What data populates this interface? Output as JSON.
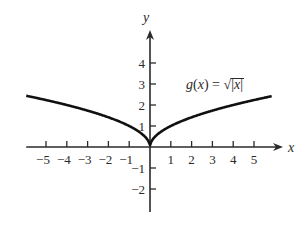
{
  "chart_data": {
    "type": "line",
    "title": "",
    "function_label": "g(x) = √|x|",
    "function_label_parts": {
      "name": "g",
      "open_paren": "(",
      "var": "x",
      "close_paren": ")",
      "equals": " = ",
      "radical": "√",
      "abs_open": "|",
      "abs_var": "x",
      "abs_close": "|"
    },
    "xlabel": "x",
    "ylabel": "y",
    "xlim": [
      -6,
      6.2
    ],
    "ylim": [
      -3,
      5
    ],
    "xticks": [
      -5,
      -4,
      -3,
      -2,
      -1,
      1,
      2,
      3,
      4,
      5
    ],
    "xtick_labels": [
      "−5",
      "−4",
      "−3",
      "−2",
      "−1",
      "1",
      "2",
      "3",
      "4",
      "5"
    ],
    "yticks": [
      -2,
      -1,
      1,
      2,
      3,
      4
    ],
    "ytick_labels": [
      "−2",
      "−1",
      "1",
      "2",
      "3",
      "4"
    ],
    "grid": false,
    "legend": null,
    "series": [
      {
        "name": "g(x) = √|x|",
        "x": [
          -5.95,
          -5,
          -4,
          -3,
          -2,
          -1,
          -0.5,
          -0.1,
          0,
          0.1,
          0.5,
          1,
          2,
          3,
          4,
          5,
          5.85
        ],
        "y": [
          2.44,
          2.24,
          2.0,
          1.73,
          1.41,
          1.0,
          0.71,
          0.32,
          0,
          0.32,
          0.71,
          1.0,
          1.41,
          1.73,
          2.0,
          2.24,
          2.42
        ],
        "color": "#111111"
      }
    ],
    "colors": {
      "curve": "#111111",
      "axes": "#2a2a2a",
      "background": "#ffffff"
    }
  }
}
